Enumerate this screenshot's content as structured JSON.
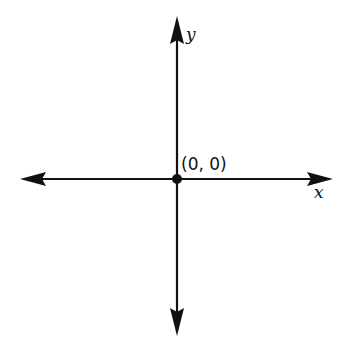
{
  "diagram": {
    "type": "coordinate-axes",
    "colors": {
      "axis": "#111111",
      "background": "#ffffff"
    },
    "axes": {
      "x": {
        "label": "x",
        "direction": "bidirectional"
      },
      "y": {
        "label": "y",
        "direction": "bidirectional"
      }
    },
    "origin": {
      "label": "(0, 0)",
      "point": "filled-dot"
    }
  }
}
